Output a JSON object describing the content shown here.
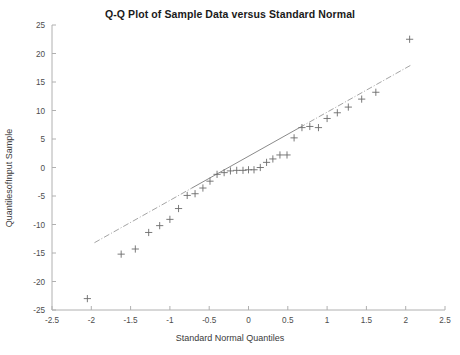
{
  "chart_data": {
    "type": "scatter",
    "title": "Q-Q Plot of Sample Data versus Standard Normal",
    "xlabel": "Standard Normal Quantiles",
    "ylabel": "QuantilesofInput Sample",
    "xlim": [
      -2.5,
      2.5
    ],
    "ylim": [
      -25,
      25
    ],
    "xticks": [
      -2.5,
      -2,
      -1.5,
      -1,
      -0.5,
      0,
      0.5,
      1,
      1.5,
      2,
      2.5
    ],
    "xticklabels": [
      "-2.5",
      "-2",
      "-1.5",
      "-1",
      "-0.5",
      "0",
      "0.5",
      "1",
      "1.5",
      "2",
      "2.5"
    ],
    "yticks": [
      -25,
      -20,
      -15,
      -10,
      -5,
      0,
      5,
      10,
      15,
      20,
      25
    ],
    "yticklabels": [
      "-25",
      "-20",
      "-15",
      "-10",
      "-5",
      "0",
      "5",
      "10",
      "15",
      "20",
      "25"
    ],
    "grid": false,
    "legend": "none",
    "marker": "plus",
    "marker_color": "#6b6b6b",
    "line_color": "#9a9a9a",
    "axis_color": "#b0b0b0",
    "series": [
      {
        "name": "Sample Quantiles",
        "marker": "+",
        "x": [
          -2.05,
          -1.62,
          -1.44,
          -1.27,
          -1.13,
          -1.0,
          -0.89,
          -0.78,
          -0.68,
          -0.58,
          -0.49,
          -0.4,
          -0.31,
          -0.23,
          -0.15,
          -0.07,
          0.0,
          0.07,
          0.15,
          0.23,
          0.31,
          0.4,
          0.49,
          0.58,
          0.68,
          0.78,
          0.89,
          1.0,
          1.13,
          1.27,
          1.44,
          1.62,
          2.05
        ],
        "y": [
          -23.0,
          -15.2,
          -14.3,
          -11.4,
          -10.2,
          -9.1,
          -7.2,
          -4.9,
          -4.6,
          -3.6,
          -2.4,
          -1.2,
          -0.9,
          -0.6,
          -0.5,
          -0.5,
          -0.4,
          -0.4,
          0.0,
          0.9,
          1.5,
          2.2,
          2.2,
          5.2,
          7.0,
          7.2,
          7.0,
          8.6,
          9.6,
          10.6,
          12.0,
          13.2,
          22.5
        ]
      }
    ],
    "reference_line": {
      "name": "Quartile reference line",
      "style": "solid-center-with-dashdot-extension",
      "solid_x": [
        -0.72,
        0.65
      ],
      "solid_y": [
        -3.6,
        7.0
      ],
      "full_x": [
        -1.96,
        2.08
      ],
      "full_y": [
        -13.2,
        18.2
      ]
    }
  }
}
